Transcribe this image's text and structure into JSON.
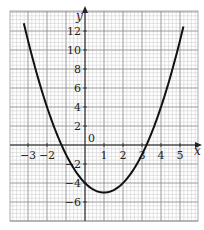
{
  "chart_data": {
    "type": "line",
    "title": "",
    "xlabel": "x",
    "ylabel": "y",
    "xlim": [
      -3.9,
      5.7
    ],
    "ylim": [
      -8,
      14
    ],
    "grid": true,
    "x_ticks": [
      -3,
      -2,
      -1,
      0,
      1,
      2,
      3,
      4,
      5
    ],
    "x_tick_labels": [
      "−3",
      "−2",
      "",
      "0",
      "1",
      "2",
      "3",
      "4",
      "5"
    ],
    "y_ticks": [
      -6,
      -4,
      -2,
      2,
      4,
      6,
      8,
      10,
      12
    ],
    "y_tick_labels": [
      "−6",
      "−4",
      "−2",
      "2",
      "4",
      "6",
      "8",
      "10",
      "12"
    ],
    "series": [
      {
        "name": "y = x² − 2x − 4",
        "x": [
          -3.2,
          -3,
          -2.5,
          -2,
          -1.5,
          -1,
          -0.5,
          0,
          0.5,
          1,
          1.5,
          2,
          2.5,
          3,
          3.5,
          4,
          4.5,
          5,
          5.2
        ],
        "y": [
          12.64,
          11,
          7.25,
          4,
          1.25,
          -1,
          -2.75,
          -4,
          -4.75,
          -5,
          -4.75,
          -4,
          -2.75,
          -1,
          1.25,
          4,
          7.25,
          11,
          12.64
        ]
      }
    ],
    "annotations": {
      "vertex": [
        1,
        -5
      ],
      "roots": [
        -1.24,
        3.24
      ],
      "y_intercept": -4
    }
  },
  "labels": {
    "x_axis": "x",
    "y_axis": "y",
    "origin": "0"
  },
  "colors": {
    "grid_minor": "#c8c8c8",
    "grid_major": "#8a8a8a",
    "axis": "#222222",
    "curve": "#111111"
  }
}
